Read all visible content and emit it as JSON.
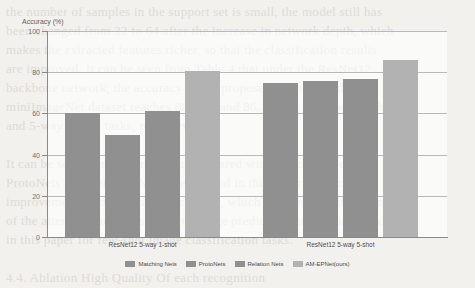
{
  "background_text": "the number of samples in the support set is small, the model still has\nbeen changed from 32 to 64 after the increase in network depth, which\nmakes the extracted features richer, so that the classification results\nare improved. It can be seen from Table 4 that under the ResNet12\nbackbone network, the accuracy of the proposed method on the\nminiImageNet dataset reaches 80.56% and 86.12% in the 5-way 1-shot\nand 5-way 5-shot tasks, respectively.\n\nIt can be seen from Figure 8 that compared with Matching Nets,\nProtoNets and Relation Nets, the method in this paper has a certain\nimprovement in classification accuracy, which verifies the effectiveness\nof the attention mechanism and the edge prediction module proposed\nin this paper for few-shot image classification tasks.\n\n4.4. Ablation High Quality Of each recognition\nThe feature distribution of deep learning step 2 is of great practical worth",
  "chart_data": {
    "type": "bar",
    "title": "",
    "xlabel": "",
    "ylabel": "Accuracy (%)",
    "ylim": [
      0,
      100
    ],
    "yticks": [
      0,
      20,
      40,
      60,
      80,
      100
    ],
    "grid": true,
    "legend_position": "bottom",
    "categories": [
      "ResNet12 5-way 1-shot",
      "ResNet12 5-way 5-shot"
    ],
    "series": [
      {
        "name": "Matching Nets",
        "color": "#909090",
        "values": [
          60.0,
          75.0
        ]
      },
      {
        "name": "ProtoNets",
        "color": "#909090",
        "values": [
          49.5,
          75.8
        ]
      },
      {
        "name": "Relation Nets",
        "color": "#909090",
        "values": [
          61.2,
          76.8
        ]
      },
      {
        "name": "AM-EPNet(ours)",
        "color": "#b2b2b2",
        "values": [
          80.5,
          86.1
        ]
      }
    ]
  }
}
